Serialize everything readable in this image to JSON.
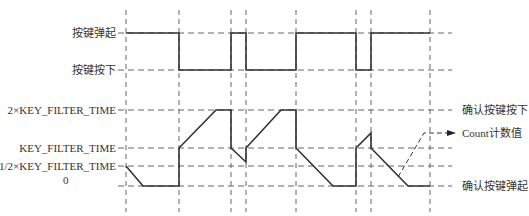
{
  "diagram": {
    "title": "",
    "colors": {
      "line": "#333333",
      "grid": "#555555",
      "text": "#333333"
    },
    "key_signal": {
      "levels": {
        "up": {
          "label": "按键弹起",
          "y": 33
        },
        "down": {
          "label": "按键按下",
          "y": 70
        }
      },
      "points": [
        [
          126,
          33
        ],
        [
          179,
          33
        ],
        [
          179,
          70
        ],
        [
          231,
          70
        ],
        [
          231,
          33
        ],
        [
          246,
          33
        ],
        [
          246,
          70
        ],
        [
          296,
          70
        ],
        [
          296,
          33
        ],
        [
          356,
          33
        ],
        [
          356,
          70
        ],
        [
          371,
          70
        ],
        [
          371,
          33
        ],
        [
          430,
          33
        ]
      ]
    },
    "counter": {
      "levels": [
        {
          "label": "2×KEY_FILTER_TIME",
          "y": 110
        },
        {
          "label": "KEY_FILTER_TIME",
          "y": 148
        },
        {
          "label": "1/2×KEY_FILTER_TIME",
          "y": 166
        },
        {
          "label": "0",
          "y": 186
        }
      ],
      "points": [
        [
          126,
          166
        ],
        [
          143,
          186
        ],
        [
          179,
          186
        ],
        [
          179,
          148
        ],
        [
          216,
          110
        ],
        [
          231,
          110
        ],
        [
          231,
          148
        ],
        [
          246,
          162
        ],
        [
          246,
          148
        ],
        [
          281,
          110
        ],
        [
          296,
          110
        ],
        [
          296,
          148
        ],
        [
          333,
          186
        ],
        [
          356,
          186
        ],
        [
          356,
          148
        ],
        [
          371,
          133
        ],
        [
          371,
          148
        ],
        [
          408,
          186
        ],
        [
          430,
          186
        ]
      ]
    },
    "time_markers_x": [
      126,
      179,
      231,
      246,
      296,
      356,
      371,
      430
    ],
    "right_labels": [
      {
        "label": "确认按键按下",
        "y": 110
      },
      {
        "label": "Count计数值",
        "y": 133
      },
      {
        "label": "确认按键弹起",
        "y": 186
      }
    ],
    "count_pointer": {
      "from": [
        398,
        177
      ],
      "corner": [
        424,
        133
      ],
      "arrow_tip": [
        456,
        133
      ]
    }
  },
  "labels": {
    "key_up": "按键弹起",
    "key_down": "按键按下",
    "two_kft": "2×KEY_FILTER_TIME",
    "kft": "KEY_FILTER_TIME",
    "half_kft": "1/2×KEY_FILTER_TIME",
    "zero": "0",
    "confirm_down": "确认按键按下",
    "count_value": "Count计数值",
    "confirm_up": "确认按键弹起"
  }
}
